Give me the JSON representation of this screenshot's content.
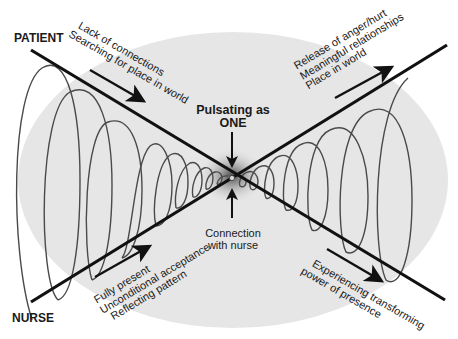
{
  "diagram": {
    "roles": {
      "patient": "PATIENT",
      "nurse": "NURSE"
    },
    "center": {
      "top_line1": "Pulsating as",
      "top_line2": "ONE",
      "bottom_line1": "Connection",
      "bottom_line2": "with nurse"
    },
    "notes": {
      "patient_before": [
        "Lack of connections",
        "Searching for place in world"
      ],
      "patient_after": [
        "Release of anger/hurt",
        "Meaningful relationships",
        "Place in world"
      ],
      "nurse_before": [
        "Fully present",
        "Unconditional acceptance",
        "Reflecting pattern"
      ],
      "nurse_after": [
        "Experiencing transforming",
        "power of presence"
      ]
    },
    "colors": {
      "background": "#ffffff",
      "ellipse_fill": "#e6e6e6",
      "line": "#111111",
      "spiral": "#4a4a4a",
      "center_glow": "#5a5a5a"
    }
  }
}
